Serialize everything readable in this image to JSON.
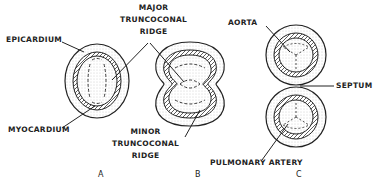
{
  "labels": {
    "epicardium": "EPICARDIUM",
    "myocardium": "MYOCARDIUM",
    "major_ridge": [
      "MAJOR",
      "TRUNCOCONAL",
      "RIDGE"
    ],
    "minor_ridge": [
      "MINOR",
      "TRUNCOCONAL",
      "RIDGE"
    ],
    "aorta": "AORTA",
    "septum": "SEPTUM",
    "pulmonary_artery": "PULMONARY ARTERY"
  },
  "panels": [
    "A",
    "B",
    "C"
  ],
  "colors": {
    "ink": "#222222",
    "stipple": "#cfcfcf",
    "background": "#ffffff"
  }
}
